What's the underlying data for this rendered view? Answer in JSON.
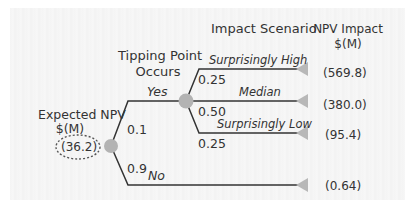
{
  "headers": {
    "expected_npv": [
      "Expected NPV",
      "$(M)"
    ],
    "tipping_point": [
      "Tipping Point",
      "Occurs"
    ],
    "impact_scenario": "Impact Scenario",
    "npv_impact": [
      "NPV Impact",
      "$(M)"
    ]
  },
  "root": {
    "value": "(36.2)"
  },
  "branches": {
    "yes": {
      "label": "Yes",
      "probability": "0.1"
    },
    "no": {
      "label": "No",
      "probability": "0.9",
      "npv": "(0.64)"
    }
  },
  "scenarios": [
    {
      "label": "Surprisingly High",
      "probability": "0.25",
      "npv": "(569.8)"
    },
    {
      "label": "Median",
      "probability": "0.50",
      "npv": "(380.0)"
    },
    {
      "label": "Surprisingly Low",
      "probability": "0.25",
      "npv": "(95.4)"
    }
  ],
  "colors": {
    "line": "#333333",
    "node": "#b3b3b3",
    "terminal": "#b8b8b8",
    "panel": "#f4f4f4"
  }
}
